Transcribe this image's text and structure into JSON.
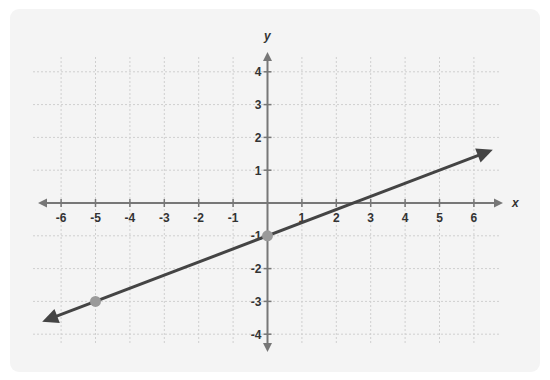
{
  "chart_data": {
    "type": "line",
    "title": "",
    "xlabel": "x",
    "ylabel": "y",
    "xlim": [
      -6.5,
      6.5
    ],
    "ylim": [
      -4.5,
      4.5
    ],
    "grid": true,
    "x_ticks": [
      -6,
      -5,
      -4,
      -3,
      -2,
      -1,
      1,
      2,
      3,
      4,
      5,
      6
    ],
    "y_ticks": [
      -4,
      -3,
      -2,
      -1,
      1,
      2,
      3,
      4
    ],
    "series": [
      {
        "name": "line",
        "equation": "y = 0.4x - 1",
        "slope": 0.4,
        "intercept": -1,
        "arrows": "both",
        "color": "#444444"
      }
    ],
    "points": [
      {
        "x": 0,
        "y": -1,
        "color": "#9a9a9a"
      },
      {
        "x": -5,
        "y": -3,
        "color": "#9a9a9a"
      }
    ]
  },
  "axes": {
    "x_label": "x",
    "y_label": "y"
  },
  "colors": {
    "card_bg": "#f4f4f4",
    "axis": "#777777",
    "grid": "#cfcfcf",
    "line": "#444444",
    "point": "#9a9a9a",
    "label": "#333333"
  }
}
